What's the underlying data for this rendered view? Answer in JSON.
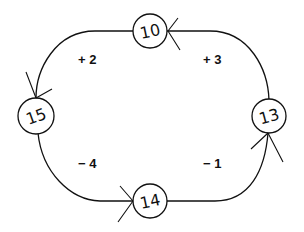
{
  "diagram": {
    "type": "cycle",
    "nodes": [
      {
        "id": "top",
        "label": "10"
      },
      {
        "id": "right",
        "label": "13"
      },
      {
        "id": "bottom",
        "label": "14"
      },
      {
        "id": "left",
        "label": "15"
      }
    ],
    "edges": [
      {
        "from": "top",
        "to": "left",
        "label": "+ 2"
      },
      {
        "from": "right",
        "to": "top",
        "label": "+ 3"
      },
      {
        "from": "left",
        "to": "bottom",
        "label": "− 4"
      },
      {
        "from": "bottom",
        "to": "right",
        "label": "− 1"
      }
    ],
    "colors": {
      "stroke": "#111111",
      "background": "#ffffff"
    }
  }
}
